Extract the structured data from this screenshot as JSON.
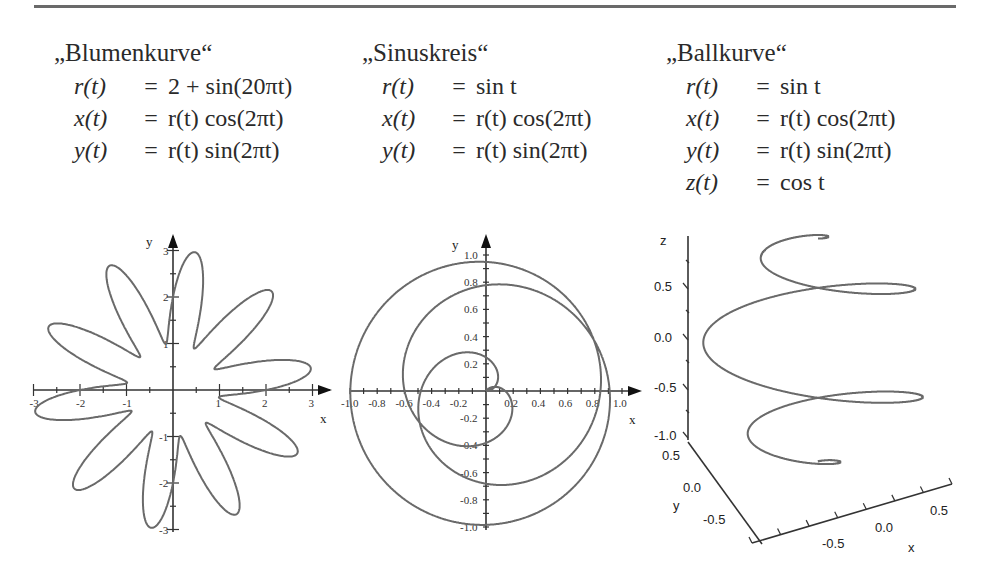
{
  "panels": [
    {
      "title": "„Blumenkurve“",
      "equations": [
        {
          "lhs": "r(t)",
          "op": "=",
          "rhs": "2 + sin(20πt)"
        },
        {
          "lhs": "x(t)",
          "op": "=",
          "rhs": "r(t) cos(2πt)"
        },
        {
          "lhs": "y(t)",
          "op": "=",
          "rhs": "r(t) sin(2πt)"
        }
      ]
    },
    {
      "title": "„Sinuskreis“",
      "equations": [
        {
          "lhs": "r(t)",
          "op": "=",
          "rhs": "sin t"
        },
        {
          "lhs": "x(t)",
          "op": "=",
          "rhs": "r(t) cos(2πt)"
        },
        {
          "lhs": "y(t)",
          "op": "=",
          "rhs": "r(t) sin(2πt)"
        }
      ]
    },
    {
      "title": "„Ballkurve“",
      "equations": [
        {
          "lhs": "r(t)",
          "op": "=",
          "rhs": "sin t"
        },
        {
          "lhs": "x(t)",
          "op": "=",
          "rhs": "r(t) cos(2πt)"
        },
        {
          "lhs": "y(t)",
          "op": "=",
          "rhs": "r(t) sin(2πt)"
        },
        {
          "lhs": "z(t)",
          "op": "=",
          "rhs": "cos t"
        }
      ]
    }
  ],
  "chart_data": [
    {
      "type": "line",
      "title": "Blumenkurve",
      "xlabel": "x",
      "ylabel": "y",
      "xlim": [
        -3,
        3
      ],
      "ylim": [
        -3,
        3
      ],
      "xticks": [
        "-3",
        "-2",
        "-1",
        "1",
        "2",
        "3"
      ],
      "yticks": [
        "3",
        "2",
        "1",
        "-1",
        "-2",
        "-3"
      ],
      "grid": false,
      "parametric": {
        "r": "2 + sin(20πt)",
        "x": "r(t) cos(2πt)",
        "y": "r(t) sin(2πt)",
        "t_range": [
          0,
          1
        ]
      },
      "petals": 10
    },
    {
      "type": "line",
      "title": "Sinuskreis",
      "xlabel": "x",
      "ylabel": "y",
      "xlim": [
        -1.0,
        1.0
      ],
      "ylim": [
        -1.0,
        1.0
      ],
      "xticks": [
        "-1.0",
        "-0.8",
        "-0.6",
        "-0.4",
        "-0.2",
        "0.2",
        "0.4",
        "0.6",
        "0.8",
        "1.0"
      ],
      "yticks": [
        "1.0",
        "0.8",
        "0.6",
        "0.4",
        "0.2",
        "-0.2",
        "-0.4",
        "-0.6",
        "-0.8",
        "-1.0"
      ],
      "grid": false,
      "parametric": {
        "r": "sin t",
        "x": "r(t) cos(2πt)",
        "y": "r(t) sin(2πt)"
      }
    },
    {
      "type": "line",
      "title": "Ballkurve",
      "xlabel": "x",
      "ylabel": "y",
      "zlabel": "z",
      "xticks": [
        "-0.5",
        "0.0",
        "0.5"
      ],
      "yticks": [
        "0.5",
        "0.0",
        "-0.5"
      ],
      "zticks": [
        "0.5",
        "0.0",
        "-0.5",
        "-1.0"
      ],
      "grid": false,
      "parametric": {
        "r": "sin t",
        "x": "r(t) cos(2πt)",
        "y": "r(t) sin(2πt)",
        "z": "cos t"
      }
    }
  ]
}
